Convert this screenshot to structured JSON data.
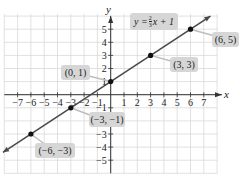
{
  "chart_data": {
    "type": "line",
    "title": "",
    "xlabel": "x",
    "ylabel": "y",
    "xlim": [
      -8,
      8
    ],
    "ylim": [
      -6,
      6
    ],
    "grid": true,
    "x_ticks": [
      -7,
      -6,
      -5,
      -4,
      -3,
      -2,
      -1,
      1,
      2,
      3,
      4,
      5,
      6,
      7
    ],
    "y_ticks": [
      -5,
      -4,
      -3,
      -2,
      -1,
      1,
      2,
      3,
      4,
      5
    ],
    "equation": "y = 2/3 x + 1",
    "series": [
      {
        "name": "y = 2/3 x + 1",
        "slope": 0.6667,
        "intercept": 1,
        "points": [
          {
            "x": -6,
            "y": -3,
            "label": "(−6, −3)"
          },
          {
            "x": -3,
            "y": -1,
            "label": "(−3, −1)"
          },
          {
            "x": 0,
            "y": 1,
            "label": "(0, 1)"
          },
          {
            "x": 3,
            "y": 3,
            "label": "(3, 3)"
          },
          {
            "x": 6,
            "y": 5,
            "label": "(6, 5)"
          }
        ]
      }
    ]
  },
  "labels": {
    "equation_prefix": "y = ",
    "equation_num": "2",
    "equation_den": "3",
    "equation_suffix": "x + 1",
    "x_axis": "x",
    "y_axis": "y",
    "p_6_5": "(6, 5)",
    "p_3_3": "(3, 3)",
    "p_0_1": "(0, 1)",
    "p_m3_m1": "(−3, −1)",
    "p_m6_m3": "(−6, −3)"
  },
  "colors": {
    "grid": "#cfcfcf",
    "axis": "#333333",
    "line": "#555555",
    "label_bg": "#d6d6d6"
  }
}
